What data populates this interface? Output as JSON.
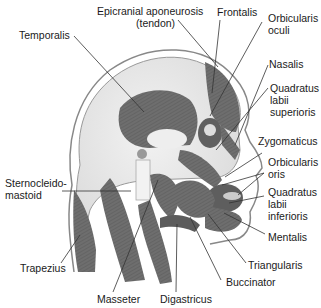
{
  "figure": {
    "labels": {
      "epicranial": "Epicranial aponeurosis",
      "epicranial_sub": "(tendon)",
      "frontalis": "Frontalis",
      "temporalis": "Temporalis",
      "orbicularis_oculi_1": "Orbicularis",
      "orbicularis_oculi_2": "oculi",
      "nasalis": "Nasalis",
      "quadratus_sup_1": "Quadratus",
      "quadratus_sup_2": "labii",
      "quadratus_sup_3": "superioris",
      "zygomaticus": "Zygomaticus",
      "orbicularis_oris_1": "Orbicularis",
      "orbicularis_oris_2": "oris",
      "quadratus_inf_1": "Quadratus",
      "quadratus_inf_2": "labii",
      "quadratus_inf_3": "inferioris",
      "mentalis": "Mentalis",
      "triangularis": "Triangularis",
      "buccinator": "Buccinator",
      "digastricus": "Digastricus",
      "masseter": "Masseter",
      "sternocleido_1": "Sternocleido-",
      "sternocleido_2": "mastoid",
      "trapezius": "Trapezius"
    },
    "colors": {
      "muscle": "#6e6e6e",
      "muscle_dark": "#555555",
      "skin_outline": "#777777",
      "skull": "#e8e8e8",
      "leader_line": "#333333"
    }
  }
}
